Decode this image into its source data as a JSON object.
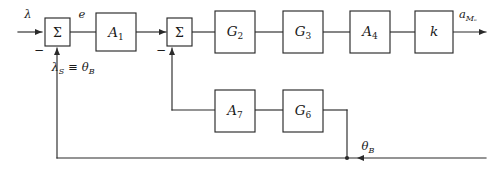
{
  "diagram": {
    "type": "control-block-diagram",
    "stroke_color": "#2a2a2a",
    "background_color": "#ffffff",
    "blocks": [
      {
        "id": "sum1",
        "label": "Σ",
        "kind": "summing-junction"
      },
      {
        "id": "a1",
        "label": "A",
        "sub": "1",
        "kind": "gain-block"
      },
      {
        "id": "sum2",
        "label": "Σ",
        "kind": "summing-junction"
      },
      {
        "id": "g2",
        "label": "G",
        "sub": "2",
        "kind": "gain-block"
      },
      {
        "id": "g3",
        "label": "G",
        "sub": "3",
        "kind": "gain-block"
      },
      {
        "id": "a4",
        "label": "A",
        "sub": "4",
        "kind": "gain-block"
      },
      {
        "id": "k",
        "label": "k",
        "sub": "",
        "kind": "gain-block"
      },
      {
        "id": "a7",
        "label": "A",
        "sub": "7",
        "kind": "gain-block"
      },
      {
        "id": "g6",
        "label": "G",
        "sub": "6",
        "kind": "gain-block"
      }
    ],
    "signals": {
      "input": "λ",
      "error": "e",
      "feedback_input": "λ",
      "feedback_input_sub": "S",
      "equiv_sign": "≡",
      "feedback_equiv": "θ",
      "feedback_equiv_sub": "B",
      "output": "a",
      "output_sub": "Mₑ",
      "inner_feedback": "θ",
      "inner_feedback_sub": "B"
    },
    "signs": {
      "sum1_negative": "−",
      "sum2_negative": "−"
    }
  }
}
